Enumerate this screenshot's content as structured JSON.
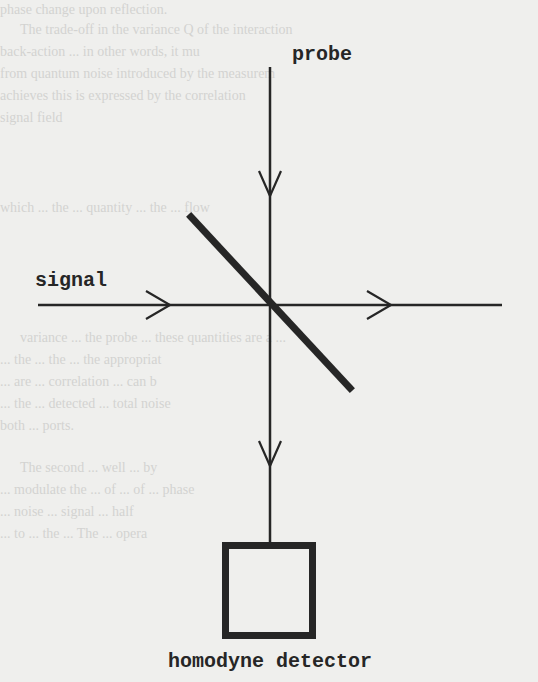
{
  "diagram": {
    "labels": {
      "probe": "probe",
      "signal": "signal",
      "detector": "homodyne detector"
    },
    "components": [
      {
        "id": "probe-beam",
        "type": "beam",
        "direction": "down"
      },
      {
        "id": "signal-beam",
        "type": "beam",
        "direction": "right"
      },
      {
        "id": "beam-splitter",
        "type": "mirror",
        "orientation": "diagonal"
      },
      {
        "id": "homodyne-detector",
        "type": "detector-box"
      }
    ],
    "colors": {
      "ink": "#262626",
      "paper": "#efefed",
      "ghost_text": "#d3d3d1"
    }
  },
  "background_text": [
    "phase change upon reflection.",
    "The trade-off in the variance Q of the interaction",
    "back-action ... in other words, it mu",
    "from quantum noise introduced by the measurem",
    "achieves this is expressed by the correlation",
    "signal field",
    "which ... the ... quantity ... the ... flow",
    "variance ... the probe ... these quantities are a ...",
    "... the ... the ... the appropriat",
    "... are ... correlation ... can b",
    "... the ... detected ... total noise",
    "both ... ports.",
    "The second ... well ... by",
    "... modulate the ... of ... of ... phase",
    "... noise ... signal ... half",
    "... to ... the ... The ... opera"
  ]
}
